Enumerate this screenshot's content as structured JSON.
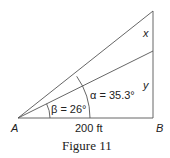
{
  "figure": {
    "caption": "Figure 11",
    "points": {
      "A": "A",
      "B": "B"
    },
    "segments": {
      "x": "x",
      "y": "y"
    },
    "base_label": "200 ft",
    "angles": {
      "beta": "β = 26°",
      "alpha": "α = 35.3°"
    }
  }
}
